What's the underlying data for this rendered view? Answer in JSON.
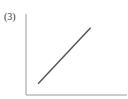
{
  "figure_label": "(3)",
  "colors": {
    "axis": "#9a9a9a",
    "line": "#555555"
  },
  "chart_data": {
    "type": "line",
    "title": "",
    "xlabel": "",
    "ylabel": "",
    "grid": false,
    "xlim": [
      0,
      10
    ],
    "ylim": [
      0,
      10
    ],
    "series": [
      {
        "name": "line",
        "x": [
          1.2,
          6.4
        ],
        "y": [
          1.4,
          8.3
        ]
      }
    ]
  }
}
